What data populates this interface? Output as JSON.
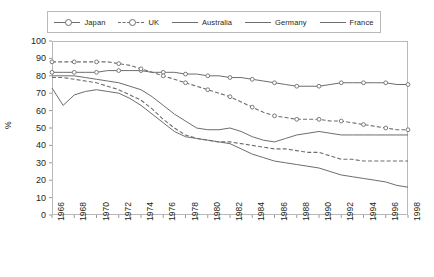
{
  "chart_data": {
    "type": "line",
    "title": "",
    "xlabel": "",
    "ylabel": "%",
    "ylim": [
      0,
      100
    ],
    "ytick_step": 10,
    "yticks": [
      "100",
      "90",
      "80",
      "70",
      "60",
      "50",
      "40",
      "30",
      "20",
      "10",
      "0"
    ],
    "xlim": [
      1966,
      1998
    ],
    "grid": false,
    "legend_position": "top",
    "x": [
      1966,
      1967,
      1968,
      1969,
      1970,
      1971,
      1972,
      1973,
      1974,
      1975,
      1976,
      1977,
      1978,
      1979,
      1980,
      1981,
      1982,
      1983,
      1984,
      1985,
      1986,
      1987,
      1988,
      1989,
      1990,
      1991,
      1992,
      1993,
      1994,
      1995,
      1996,
      1997,
      1998
    ],
    "xtick_labels": [
      "1966",
      "1968",
      "1970",
      "1972",
      "1974",
      "1976",
      "1978",
      "1980",
      "1982",
      "1984",
      "1986",
      "1988",
      "1990",
      "1992",
      "1994",
      "1996",
      "1998"
    ],
    "series": [
      {
        "name": "Japan",
        "style": "solid",
        "marker": "circle",
        "color": "#6d6d6d",
        "values": [
          82,
          82,
          82,
          82,
          82,
          83,
          83,
          83,
          83,
          82,
          82,
          82,
          81,
          81,
          80,
          80,
          79,
          79,
          78,
          77,
          76,
          75,
          74,
          74,
          74,
          75,
          76,
          76,
          76,
          76,
          76,
          75,
          75
        ]
      },
      {
        "name": "UK",
        "style": "dashed",
        "marker": "circle",
        "color": "#6d6d6d",
        "values": [
          88,
          88,
          88,
          88,
          88,
          88,
          87,
          86,
          84,
          82,
          80,
          78,
          76,
          74,
          72,
          70,
          68,
          65,
          62,
          59,
          57,
          56,
          55,
          55,
          55,
          54,
          54,
          53,
          52,
          51,
          50,
          49,
          49
        ]
      },
      {
        "name": "Australia",
        "style": "solid",
        "marker": "none",
        "color": "#6d6d6d",
        "values": [
          80,
          80,
          80,
          79,
          78,
          77,
          76,
          74,
          72,
          68,
          63,
          58,
          54,
          50,
          49,
          49,
          50,
          48,
          45,
          43,
          42,
          44,
          46,
          47,
          48,
          47,
          46,
          46,
          46,
          46,
          46,
          46,
          46
        ]
      },
      {
        "name": "Germany",
        "style": "dashed",
        "marker": "none",
        "color": "#6d6d6d",
        "values": [
          79,
          79,
          78,
          77,
          76,
          74,
          72,
          69,
          66,
          61,
          55,
          50,
          46,
          44,
          43,
          42,
          42,
          41,
          40,
          39,
          38,
          38,
          37,
          36,
          36,
          34,
          32,
          32,
          31,
          31,
          31,
          31,
          31
        ]
      },
      {
        "name": "France",
        "style": "solid",
        "marker": "none",
        "color": "#6d6d6d",
        "values": [
          73,
          63,
          69,
          71,
          72,
          71,
          70,
          67,
          63,
          58,
          53,
          48,
          45,
          44,
          43,
          42,
          41,
          38,
          35,
          33,
          31,
          30,
          29,
          28,
          27,
          25,
          23,
          22,
          21,
          20,
          19,
          17,
          16
        ]
      }
    ]
  }
}
